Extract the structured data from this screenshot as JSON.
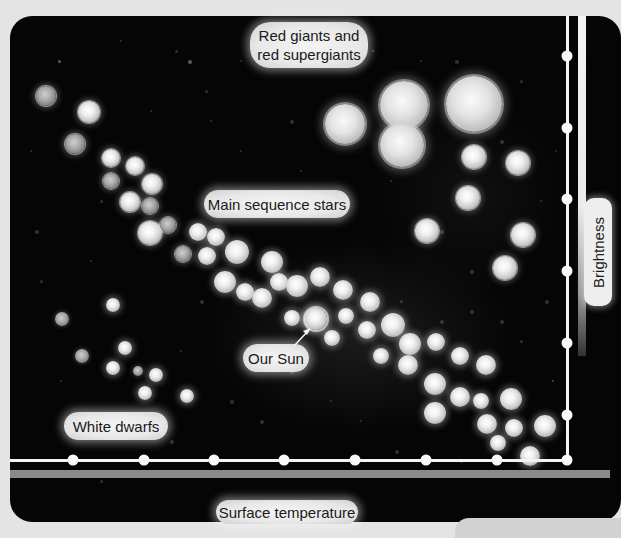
{
  "diagram": {
    "labels": {
      "red_giants": "Red giants and\nred supergiants",
      "red_giants_line1": "Red giants and",
      "red_giants_line2": "red supergiants",
      "main_sequence": "Main sequence stars",
      "our_sun": "Our Sun",
      "white_dwarfs": "White dwarfs"
    },
    "axes": {
      "x_label": "Surface temperature",
      "y_label": "Brightness",
      "x_tick_count": 8,
      "y_tick_count": 7
    },
    "colors": {
      "background": "#050505",
      "frame": "#e4e4e4",
      "axis": "#f4f4f4",
      "label_bg": "#eeeeee",
      "label_text": "#1a1a1a"
    },
    "star_groups": [
      {
        "name": "red giants and supergiants",
        "stars": [
          [
            345,
            124,
            20
          ],
          [
            404,
            105,
            24
          ],
          [
            474,
            104,
            28
          ],
          [
            402,
            145,
            22
          ],
          [
            474,
            157,
            12
          ],
          [
            518,
            163,
            12
          ],
          [
            468,
            198,
            12
          ],
          [
            427,
            231,
            12
          ],
          [
            523,
            235,
            12
          ],
          [
            505,
            268,
            12
          ]
        ]
      },
      {
        "name": "upper-left blue giants",
        "stars": [
          [
            46,
            96,
            10
          ],
          [
            89,
            112,
            11
          ],
          [
            75,
            144,
            10
          ],
          [
            111,
            158,
            9
          ],
          [
            135,
            166,
            9
          ],
          [
            152,
            184,
            10
          ],
          [
            111,
            181,
            8
          ],
          [
            130,
            202,
            10
          ],
          [
            150,
            206,
            8
          ],
          [
            150,
            233,
            12
          ],
          [
            183,
            254,
            8
          ],
          [
            168,
            225,
            8
          ]
        ]
      },
      {
        "name": "main sequence",
        "stars": [
          [
            198,
            232,
            9
          ],
          [
            216,
            237,
            9
          ],
          [
            237,
            252,
            12
          ],
          [
            207,
            256,
            9
          ],
          [
            272,
            262,
            11
          ],
          [
            225,
            282,
            11
          ],
          [
            245,
            292,
            9
          ],
          [
            262,
            298,
            10
          ],
          [
            279,
            282,
            9
          ],
          [
            297,
            286,
            11
          ],
          [
            320,
            277,
            10
          ],
          [
            343,
            290,
            10
          ],
          [
            370,
            302,
            10
          ],
          [
            346,
            316,
            8
          ],
          [
            315,
            319,
            11
          ],
          [
            292,
            318,
            8
          ],
          [
            332,
            338,
            8
          ],
          [
            367,
            330,
            9
          ],
          [
            393,
            325,
            12
          ],
          [
            381,
            356,
            8
          ],
          [
            410,
            344,
            11
          ],
          [
            436,
            342,
            9
          ],
          [
            408,
            365,
            10
          ],
          [
            460,
            356,
            9
          ],
          [
            486,
            365,
            10
          ],
          [
            435,
            384,
            11
          ],
          [
            460,
            397,
            10
          ],
          [
            481,
            401,
            8
          ],
          [
            511,
            399,
            11
          ],
          [
            435,
            413,
            11
          ],
          [
            487,
            424,
            10
          ],
          [
            514,
            428,
            9
          ],
          [
            545,
            426,
            11
          ],
          [
            498,
            443,
            8
          ],
          [
            530,
            456,
            10
          ]
        ]
      },
      {
        "name": "white dwarfs",
        "stars": [
          [
            113,
            305,
            7
          ],
          [
            62,
            319,
            7
          ],
          [
            125,
            348,
            7
          ],
          [
            82,
            356,
            7
          ],
          [
            113,
            368,
            7
          ],
          [
            156,
            375,
            7
          ],
          [
            145,
            393,
            7
          ],
          [
            187,
            396,
            7
          ],
          [
            138,
            371,
            5
          ]
        ]
      }
    ],
    "sun_position": [
      316,
      319
    ]
  }
}
